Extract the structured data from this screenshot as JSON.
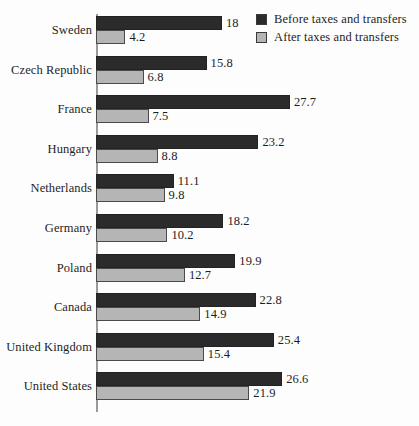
{
  "chart_data": {
    "type": "bar",
    "orientation": "horizontal",
    "title": "",
    "subtitle": "",
    "xlabel": "",
    "ylabel": "",
    "grid": false,
    "xlim": [
      0,
      29
    ],
    "legend_position": "top-right",
    "categories": [
      "Sweden",
      "Czech Republic",
      "France",
      "Hungary",
      "Netherlands",
      "Germany",
      "Poland",
      "Canada",
      "United Kingdom",
      "United States"
    ],
    "series": [
      {
        "name": "Before taxes and transfers",
        "color": "#2b2b2b",
        "values": [
          18,
          15.8,
          27.7,
          23.2,
          11.1,
          18.2,
          19.9,
          22.8,
          25.4,
          26.6
        ],
        "labels": [
          "18",
          "15.8",
          "27.7",
          "23.2",
          "11.1",
          "18.2",
          "19.9",
          "22.8",
          "25.4",
          "26.6"
        ]
      },
      {
        "name": "After taxes and transfers",
        "color": "#b5b5b5",
        "values": [
          4.2,
          6.8,
          7.5,
          8.8,
          9.8,
          10.2,
          12.7,
          14.9,
          15.4,
          21.9
        ],
        "labels": [
          "4.2",
          "6.8",
          "7.5",
          "8.8",
          "9.8",
          "10.2",
          "12.7",
          "14.9",
          "15.4",
          "21.9"
        ]
      }
    ]
  },
  "legend": {
    "items": [
      {
        "label": "Before taxes and transfers",
        "color": "#2b2b2b"
      },
      {
        "label": "After taxes and transfers",
        "color": "#b5b5b5"
      }
    ]
  },
  "colors": {
    "before": "#2b2b2b",
    "after": "#b5b5b5",
    "axis": "#9a9a9a",
    "text": "#1d1d1d",
    "background": "#fdfdfd"
  }
}
